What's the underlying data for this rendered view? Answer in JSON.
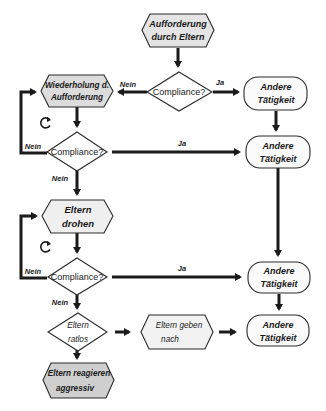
{
  "diagram": {
    "type": "flowchart",
    "colors": {
      "hex_fill_start": "#e4e4e4",
      "hex_fill_repeat": "#dcdcdc",
      "hex_fill_threat": "#efefef",
      "hex_fill_aggressive": "#cfcfcf",
      "hex_fill_giveup": "#f2f2f2",
      "terminal_fill": "#fafafa",
      "diamond_fill": "#ffffff",
      "line": "#1a1a1a"
    },
    "nodes": {
      "start": {
        "line1": "Aufforderung",
        "line2": "durch Eltern"
      },
      "compliance1": {
        "label": "Compliance?"
      },
      "repeat": {
        "line1": "Wiederholung d.",
        "line2": "Aufforderung"
      },
      "compliance2": {
        "label": "Compliance?"
      },
      "threat": {
        "line1": "Eltern",
        "line2": "drohen"
      },
      "compliance3": {
        "label": "Compliance?"
      },
      "helpless": {
        "line1": "Eltern",
        "line2": "ratlos"
      },
      "giveup": {
        "line1": "Eltern geben",
        "line2": "nach"
      },
      "aggressive": {
        "line1": "Eltern reagieren",
        "line2": "aggressiv"
      },
      "other1": {
        "line1": "Andere",
        "line2": "Tätigkeit"
      },
      "other2": {
        "line1": "Andere",
        "line2": "Tätigkeit"
      },
      "other3": {
        "line1": "Andere",
        "line2": "Tätigkeit"
      },
      "other4": {
        "line1": "Andere",
        "line2": "Tätigkeit"
      }
    },
    "edges": {
      "c1_no": "Nein",
      "c1_yes": "Ja",
      "c2_no_loop": "Nein",
      "c2_yes": "Ja",
      "c2_no_down": "Nein",
      "c3_no_loop": "Nein",
      "c3_yes": "Ja",
      "c3_no_down": "Nein"
    }
  }
}
